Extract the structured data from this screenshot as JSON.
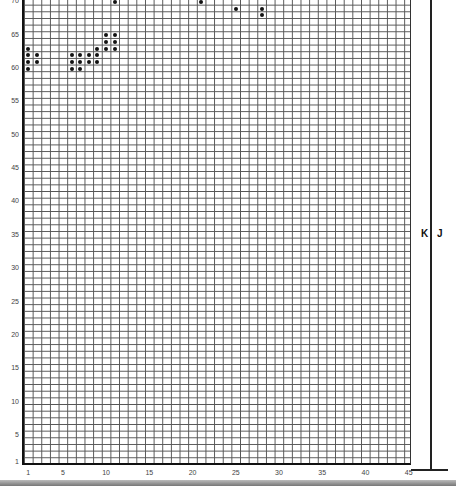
{
  "chart_data": {
    "type": "heatmap",
    "title": "",
    "columns": 45,
    "rows": 70,
    "x_ticks": [
      1,
      5,
      10,
      15,
      20,
      25,
      30,
      35,
      40,
      45
    ],
    "y_ticks": [
      1,
      5,
      10,
      15,
      20,
      25,
      30,
      35,
      40,
      45,
      50,
      55,
      60,
      65,
      70
    ],
    "side_labels": [
      "K",
      "J"
    ],
    "grid": true,
    "pattern_top_to_bottom": [
      "000000000010000000001000000000000000000000000",
      "000000000000000000000000100100000000000000000",
      "000000000000000000000000000100000000000000000",
      "000000000000000000000000000000000000000000000",
      "000000000000000000000000000000000000000000000",
      "000000000110000000000000000000000000000000000",
      "000000000110000000000000000000000000000000000",
      "100000001110000000000000000000000000000000000",
      "110001111000000000000000000000000000000000000",
      "110001111000000000000000000000000000000000000",
      "100001100000000000000000000000000000000000000",
      "000000000000000000000000000000000000000000000",
      "000000000000000000000000000000000000000000000",
      "000000000000000000000000000000000000000000000",
      "000000000000000000000000000000000000000000000",
      "000000000000000000000000000000000000000000000",
      "000000000000000000000000000000000000000000000",
      "000000000000000000000000000000000000000000000",
      "000000000000000000000000000000000000000000000",
      "000000000000000000000000000000000000000000000",
      "000000000000000000000000000000000000000000000",
      "000000000000000000000000000000000000000000000",
      "000000000000000000000000000000000000000000000",
      "000000000000000000000000000000000000000000000",
      "000000000000000000000000000000000000000000000",
      "000000000000000000000000000000000000000000000",
      "000000000000000000000000000000000000000000000",
      "000000000000000000000000000000000000000000000",
      "000000000000000000000000000000000000000000000",
      "000000000000000000000000000000000000000000000",
      "000000000000000000000000000000000000000000000",
      "000000000000000000000000000000000000000000000",
      "000000000000000000000000000000000000000000000",
      "000000000000000000000000000000000000000000000",
      "000000000000000000000000000000000000000000000",
      "000000000000000000000000000000000000000000000",
      "000000000000000000000000000000000000000000000",
      "000000000000000000000000000000000000000000000",
      "000000000000000000000000000000000000000000000",
      "000000000000000000000000000000000000000000000",
      "000000000000000000000000000000000000000000000",
      "000000000000000000000000000000000000000000000",
      "000000000000000000000000000000000000000000000",
      "000000000000000000000000000000000000000000000",
      "000000000000000000000000000000000000000000000",
      "000000000000000000000000000000000000000000000",
      "000000000000000000000000000000000000000000000",
      "000000000000000000000000000000000000000000000",
      "000000000000000000000000000000000000000000000",
      "000000000000000000000000000000000000000000000",
      "000000000000000000000000000000000000000000000",
      "000000000000000000000000000000000000000000000",
      "000000000000000000000000000000000000000000000",
      "000000000000000000000000000000000000000000000",
      "000000000000000000000000000000000000000000000",
      "000000000000000000000000000000000000000000000",
      "000000000000000000000000000000000000000000000",
      "000000000000000000000000000000000000000000000",
      "000000000000000000000000000000000000000000000",
      "000000000000000000000000000000000000000000000",
      "000000000000000000000000000000000000000000000",
      "000000000000000000000000000000000000000000000",
      "000000000000000000000000000000000000000000000",
      "000000000000000000000000000000000000000000000",
      "000000000000000000000000000000000000000000000",
      "000000000000000000000000000000000000000000000",
      "000000000000000000000000000000000000000000000",
      "000000000000000000000000000000000000000000000",
      "000000000000000000000000000000000000000000000",
      "000000000000000000000000000000000000000000000"
    ]
  },
  "labels": {
    "k": "K",
    "j": "J"
  }
}
